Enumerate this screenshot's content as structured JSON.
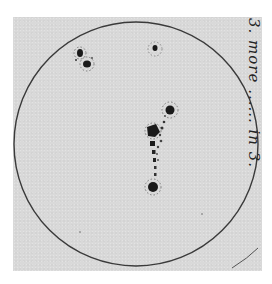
{
  "image": {
    "subject": "Hand-drawn sunspot drawing on solar disk",
    "background_color": "#ffffff",
    "paper_color": "#d9d9d9",
    "ink_color": "#1a1a1a"
  },
  "disk": {
    "cx": 136,
    "cy": 144,
    "r": 122,
    "stroke": "#3a3a3a"
  },
  "annotation": {
    "text": "3. more ...... in 3."
  },
  "sunspots": [
    {
      "id": "group-upper-left-a",
      "cx": 80,
      "cy": 53,
      "r": 3.5
    },
    {
      "id": "group-upper-left-b",
      "cx": 87,
      "cy": 64,
      "r": 3.5
    },
    {
      "id": "single-top",
      "cx": 155,
      "cy": 48,
      "r": 2.5
    },
    {
      "id": "chain-top",
      "cx": 170,
      "cy": 110,
      "r": 4.5
    },
    {
      "id": "chain-middle-large",
      "cx": 153,
      "cy": 131,
      "r": 5
    },
    {
      "id": "chain-bottom",
      "cx": 153,
      "cy": 187,
      "r": 5
    }
  ]
}
